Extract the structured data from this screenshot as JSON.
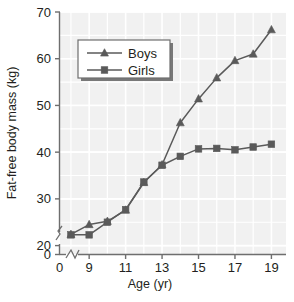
{
  "chart_data": {
    "type": "line",
    "title": "",
    "xlabel": "Age (yr)",
    "ylabel": "Fat-free body mass (kg)",
    "xlim": [
      7.4,
      19.8
    ],
    "ylim": [
      18.2,
      70
    ],
    "xticks": [
      "0",
      "9",
      "11",
      "13",
      "15",
      "17",
      "19"
    ],
    "xtick_values": [
      0,
      9,
      11,
      13,
      15,
      17,
      19
    ],
    "yticks": [
      "0",
      "20",
      "30",
      "40",
      "50",
      "60",
      "70"
    ],
    "ytick_values": [
      0,
      20,
      30,
      40,
      50,
      60,
      70
    ],
    "grid": true,
    "grid_color": "#ffffff",
    "plot_background": "#f1f1f1",
    "axis_break_x": true,
    "axis_break_y": true,
    "legend_position": "upper-left-inside",
    "series": [
      {
        "name": "Boys",
        "marker": "triangle",
        "color": "#5a5a5a",
        "x": [
          8,
          9,
          10,
          11,
          12,
          13,
          14,
          15,
          16,
          17,
          18,
          19
        ],
        "values": [
          22.4,
          24.5,
          25.2,
          27.6,
          33.5,
          37.3,
          46.3,
          51.4,
          55.9,
          59.6,
          61.0,
          66.2
        ]
      },
      {
        "name": "Girls",
        "marker": "square",
        "color": "#5a5a5a",
        "x": [
          8,
          9,
          10,
          11,
          12,
          13,
          14,
          15,
          16,
          17,
          18,
          19
        ],
        "values": [
          22.3,
          22.3,
          25.0,
          27.7,
          33.6,
          37.2,
          39.1,
          40.7,
          40.8,
          40.5,
          41.1,
          41.7
        ]
      }
    ]
  },
  "legend": {
    "items": [
      {
        "label": "Boys",
        "marker": "triangle"
      },
      {
        "label": "Girls",
        "marker": "square"
      }
    ]
  },
  "axes": {
    "x_title": "Age (yr)",
    "y_title": "Fat-free body mass (kg)"
  }
}
